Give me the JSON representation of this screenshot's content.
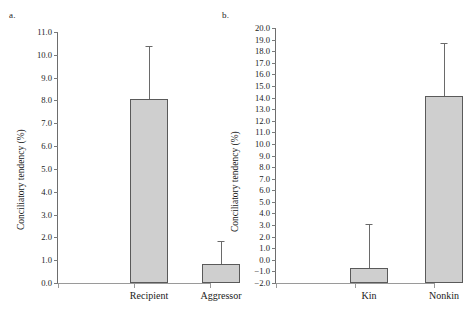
{
  "figure": {
    "background": "#ffffff",
    "bar_fill": "#cfcfcf",
    "bar_stroke": "#5a5a5a",
    "axis_color": "#6d6d6d"
  },
  "panels": [
    {
      "letter": "a.",
      "ylabel": "Conciliatory tendency (%)",
      "yticks": [
        "11.0",
        "10.0",
        "9.0",
        "8.0",
        "7.0",
        "6.0",
        "5.0",
        "4.0",
        "3.0",
        "2.0",
        "1.0",
        "0.0"
      ],
      "categories": [
        "Recipient",
        "Aggressor"
      ]
    },
    {
      "letter": "b.",
      "ylabel": "Conciliatory tendency (%)",
      "yticks": [
        "20.0",
        "19.0",
        "18.0",
        "17.0",
        "16.0",
        "15.0",
        "14.0",
        "13.0",
        "12.0",
        "11.0",
        "10.0",
        "9.0",
        "8.0",
        "7.0",
        "6.0",
        "5.0",
        "4.0",
        "3.0",
        "2.0",
        "1.0",
        "0.0",
        "−1.0",
        "−2.0"
      ],
      "categories": [
        "Kin",
        "Nonkin"
      ]
    }
  ],
  "chart_data": [
    {
      "type": "bar",
      "panel": "a.",
      "title": "",
      "xlabel": "",
      "ylabel": "Conciliatory tendency (%)",
      "categories": [
        "Recipient",
        "Aggressor"
      ],
      "values": [
        8.05,
        0.82
      ],
      "errors_upper": [
        10.4,
        1.85
      ],
      "error_type": "upper-only whisker (SE/CI upper limit)",
      "ylim": [
        0.0,
        11.0
      ],
      "ytick_step": 1.0,
      "yticks": [
        0.0,
        1.0,
        2.0,
        3.0,
        4.0,
        5.0,
        6.0,
        7.0,
        8.0,
        9.0,
        10.0,
        11.0
      ],
      "grid": false,
      "legend": null,
      "baseline": 0.0
    },
    {
      "type": "bar",
      "panel": "b.",
      "title": "",
      "xlabel": "",
      "ylabel": "Conciliatory tendency (%)",
      "categories": [
        "Kin",
        "Nonkin"
      ],
      "values": [
        -0.7,
        14.1
      ],
      "errors_upper": [
        3.1,
        18.7
      ],
      "error_type": "upper-only whisker (SE/CI upper limit)",
      "ylim": [
        -2.0,
        20.0
      ],
      "ytick_step": 1.0,
      "yticks": [
        -2.0,
        -1.0,
        0.0,
        1.0,
        2.0,
        3.0,
        4.0,
        5.0,
        6.0,
        7.0,
        8.0,
        9.0,
        10.0,
        11.0,
        12.0,
        13.0,
        14.0,
        15.0,
        16.0,
        17.0,
        18.0,
        19.0,
        20.0
      ],
      "grid": false,
      "legend": null,
      "baseline": -2.0
    }
  ],
  "geometry": {
    "panel_a": {
      "plot_left": 57,
      "plot_top": 32,
      "plot_width": 152,
      "plot_height": 251,
      "bar_width": 38,
      "bar_centers": [
        91,
        163
      ]
    },
    "panel_b": {
      "plot_left": 59,
      "plot_top": 28,
      "plot_width": 158,
      "plot_height": 255,
      "bar_width": 38,
      "bar_centers": [
        93,
        168
      ]
    }
  }
}
